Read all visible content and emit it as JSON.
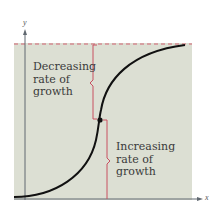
{
  "diagram": {
    "type": "logistic-growth-curve",
    "axes": {
      "x_label": "x",
      "y_label": "y"
    },
    "annotations": {
      "upper": [
        "Decreasing",
        "rate of",
        "growth"
      ],
      "lower": [
        "Increasing",
        "rate of",
        "growth"
      ]
    },
    "asymptote": "dashed horizontal upper limit",
    "inflection_point": "marked with a dot",
    "colors": {
      "background_panel": "#dcdfd3",
      "curve": "#111111",
      "brace": "#c85060",
      "asymptote": "#d06070",
      "axis": "#606870",
      "text": "#3a3a3a"
    }
  }
}
